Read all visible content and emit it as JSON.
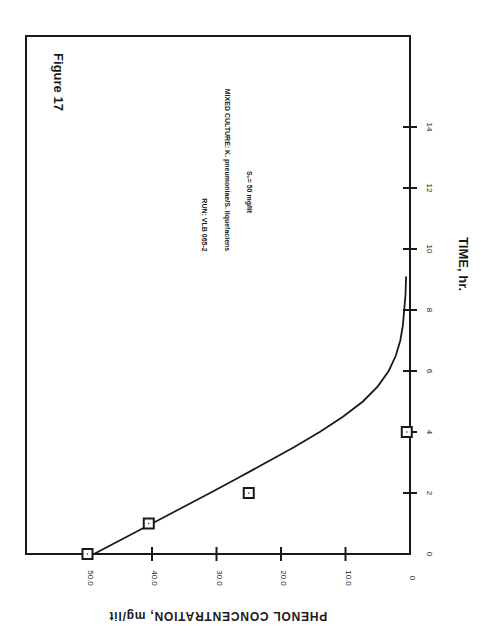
{
  "figure_label": "Figure 17",
  "annotations": {
    "run": "RUN: VLB 065-2",
    "culture": "MIXED CULTURE: K. pneumoniae/S. liquefaciens",
    "initial_conc": "S₀= 50 mg/lit"
  },
  "colors": {
    "ink": "#1a1a1a",
    "background": "#ffffff"
  },
  "chart_data": {
    "type": "scatter",
    "title": "Figure 17",
    "orientation": "rotated 90° clockwise (time axis vertical on right, concentration axis horizontal along bottom)",
    "xlabel": "TIME, hr.",
    "ylabel": "PHENOL CONCENTRATION, mg/lit",
    "xlim": [
      0,
      16
    ],
    "ylim": [
      0,
      55
    ],
    "x_ticks": [
      0,
      2,
      4,
      6,
      8,
      10,
      12,
      14
    ],
    "x_tick_labels": [
      "0",
      "2",
      "4",
      "6",
      "8",
      "10",
      "12",
      "14"
    ],
    "y_ticks": [
      0,
      10,
      20,
      30,
      40,
      50
    ],
    "y_tick_labels": [
      "0",
      "10.0",
      "20.0",
      "30.0",
      "40.0",
      "50.0"
    ],
    "grid": false,
    "legend": null,
    "series": [
      {
        "name": "Experimental",
        "marker": "square",
        "x": [
          0,
          1.0,
          2.0,
          4.0
        ],
        "y": [
          50.0,
          40.5,
          25.0,
          0.5
        ]
      },
      {
        "name": "Model fit",
        "style": "line",
        "x": [
          0,
          0.5,
          1.0,
          1.5,
          2.0,
          2.5,
          3.0,
          3.5,
          4.0,
          4.5,
          5.0,
          5.5,
          6.0,
          6.5,
          7.0,
          7.5,
          8.0,
          8.5,
          9.1
        ],
        "y": [
          49.0,
          44.5,
          40.0,
          35.5,
          31.0,
          26.6,
          22.3,
          18.0,
          14.0,
          10.4,
          7.3,
          5.0,
          3.3,
          2.2,
          1.5,
          1.1,
          0.9,
          0.7,
          0.6
        ]
      }
    ],
    "annotations": [
      "RUN: VLB 065-2",
      "MIXED CULTURE: K. pneumoniae/S. liquefaciens",
      "S₀= 50 mg/lit"
    ]
  }
}
